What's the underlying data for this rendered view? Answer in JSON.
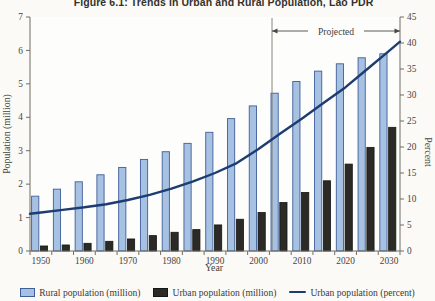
{
  "figure_title": "Figure 6.1: Trends in Urban and Rural Population, Lao PDR",
  "chart_data": {
    "type": "bar",
    "subtype": "grouped-bars-with-percent-line",
    "x": [
      1950,
      1955,
      1960,
      1965,
      1970,
      1975,
      1980,
      1985,
      1990,
      1995,
      2000,
      2005,
      2010,
      2015,
      2020,
      2025,
      2030
    ],
    "x_tick_label_years": [
      1950,
      1960,
      1970,
      1980,
      1990,
      2000,
      2010,
      2020,
      2030
    ],
    "xlabel": "Year",
    "ylabel_left": "Population (million)",
    "ylabel_right": "Percent",
    "ylim_left": [
      0,
      7
    ],
    "ytick_step_left": 1,
    "ylim_right": [
      0,
      45
    ],
    "ytick_step_right": 5,
    "grid": "off",
    "legend_position": "bottom",
    "projection_label": "Projected",
    "projection_start_year": 2005,
    "series": [
      {
        "name": "Rural population (million)",
        "type": "bar",
        "axis": "left",
        "color": "#a6c1e2",
        "border": "#3f5f98",
        "values": [
          1.64,
          1.85,
          2.07,
          2.28,
          2.5,
          2.74,
          2.97,
          3.22,
          3.55,
          3.96,
          4.34,
          4.72,
          5.07,
          5.38,
          5.6,
          5.78,
          5.9
        ]
      },
      {
        "name": "Urban population (million)",
        "type": "bar",
        "axis": "left",
        "color": "#2b2a27",
        "border": "#151513",
        "values": [
          0.15,
          0.18,
          0.23,
          0.29,
          0.36,
          0.46,
          0.56,
          0.64,
          0.78,
          0.95,
          1.15,
          1.45,
          1.75,
          2.1,
          2.6,
          3.1,
          3.7
        ]
      },
      {
        "name": "Urban population (percent)",
        "type": "line",
        "axis": "right",
        "color": "#1d3c72",
        "values": [
          7.4,
          7.9,
          8.4,
          9.0,
          9.8,
          10.8,
          12.0,
          13.4,
          15.0,
          16.9,
          19.6,
          22.6,
          25.5,
          28.5,
          31.5,
          35.0,
          38.5
        ]
      }
    ]
  },
  "legend": {
    "items": [
      {
        "label": "Rural population (million)",
        "swatch": "blue-bar"
      },
      {
        "label": "Urban population (million)",
        "swatch": "black-bar"
      },
      {
        "label": "Urban population (percent)",
        "swatch": "navy-line"
      }
    ]
  },
  "colors": {
    "background": "#fbfaf6",
    "axis": "#6e6d65",
    "tick_text": "#45443e",
    "projection_line": "#7a796f"
  }
}
